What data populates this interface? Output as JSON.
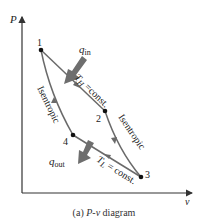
{
  "diagram": {
    "axes": {
      "y_label": "P",
      "x_label": "v"
    },
    "points": [
      {
        "id": "1",
        "label": "1"
      },
      {
        "id": "2",
        "label": "2"
      },
      {
        "id": "3",
        "label": "3"
      },
      {
        "id": "4",
        "label": "4"
      }
    ],
    "processes": {
      "p12": "T",
      "p12_sub": "H",
      "p12_rest": " =const.",
      "p23": "Isentropic",
      "p34": "T",
      "p34_sub": "L",
      "p34_rest": " = const.",
      "p41": "Isentropic"
    },
    "heat": {
      "in": "q",
      "in_sub": "in",
      "out": "q",
      "out_sub": "out"
    },
    "colors": {
      "line": "#6a6a6a",
      "arrow": "#6e6e6e",
      "axis": "#333333",
      "point": "#111111"
    }
  },
  "caption": {
    "prefix": "(a) ",
    "italic": "P-v",
    "suffix": " diagram"
  }
}
